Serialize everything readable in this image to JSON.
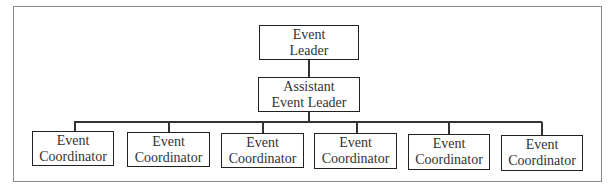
{
  "org_chart": {
    "top": {
      "line1": "Event",
      "line2": "Leader"
    },
    "assistant": {
      "line1": "Assistant",
      "line2": "Event Leader"
    },
    "coordinators": [
      {
        "line1": "Event",
        "line2": "Coordinator"
      },
      {
        "line1": "Event",
        "line2": "Coordinator"
      },
      {
        "line1": "Event",
        "line2": "Coordinator"
      },
      {
        "line1": "Event",
        "line2": "Coordinator"
      },
      {
        "line1": "Event",
        "line2": "Coordinator"
      },
      {
        "line1": "Event",
        "line2": "Coordinator"
      }
    ]
  }
}
